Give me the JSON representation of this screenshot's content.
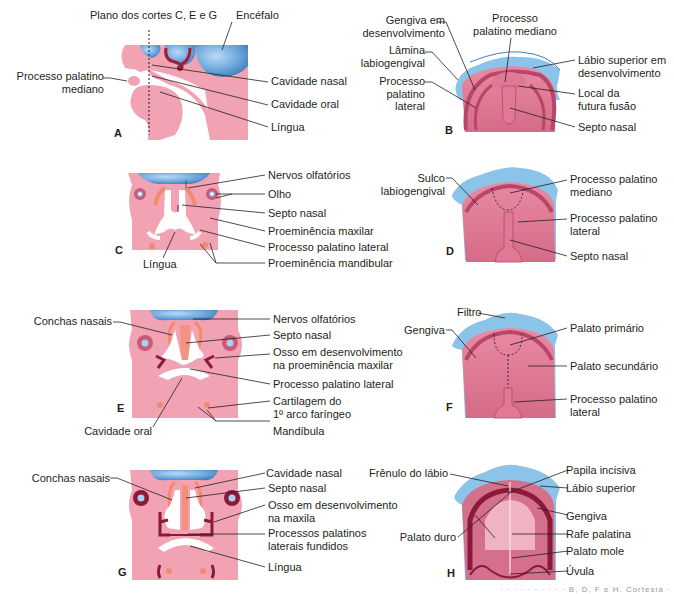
{
  "colors": {
    "tissue_pink": "#f2a3b3",
    "tissue_dark": "#c95a78",
    "tissue_mid": "#d9768f",
    "vessel_red": "#a01c3c",
    "brain_blue": "#6fa8dc",
    "lip_blue": "#8cc3e8",
    "cartilage_orange": "#f28b6b",
    "bone_maroon": "#8b1a3a",
    "text": "#231f20",
    "leader_line": "#231f20"
  },
  "panels": {
    "A": {
      "letter": "A",
      "labels": {
        "plane": "Plano dos cortes C, E e G",
        "brain": "Encéfalo",
        "median_palatine": [
          "Processo palatino",
          "mediano"
        ],
        "nasal_cavity": "Cavidade nasal",
        "oral_cavity": "Cavidade oral",
        "tongue": "Língua"
      }
    },
    "B": {
      "letter": "B",
      "labels": {
        "gum": [
          "Gengiva em",
          "desenvolvimento"
        ],
        "median_palatine": [
          "Processo",
          "palatino mediano"
        ],
        "labiogingival_lamina": [
          "Lâmina",
          "labiogengival"
        ],
        "upper_lip": [
          "Lábio superior em",
          "desenvolvimento"
        ],
        "lateral_palatine": [
          "Processo",
          "palatino",
          "lateral"
        ],
        "fusion_site": [
          "Local da",
          "futura fusão"
        ],
        "nasal_septum": "Septo nasal"
      }
    },
    "C": {
      "letter": "C",
      "labels": {
        "olfactory_nerves": "Nervos olfatórios",
        "eye": "Olho",
        "nasal_septum": "Septo nasal",
        "maxillary_prominence": "Proeminência maxilar",
        "lateral_palatine": "Processo palatino lateral",
        "tongue": "Língua",
        "mandibular_prominence": "Proeminência mandibular"
      }
    },
    "D": {
      "letter": "D",
      "labels": {
        "labiogingival_groove": [
          "Sulco",
          "labiogengival"
        ],
        "median_palatine": [
          "Processo palatino",
          "mediano"
        ],
        "lateral_palatine": [
          "Processo palatino",
          "lateral"
        ],
        "nasal_septum": "Septo nasal"
      }
    },
    "E": {
      "letter": "E",
      "labels": {
        "nasal_conchae": "Conchas nasais",
        "olfactory_nerves": "Nervos olfatórios",
        "nasal_septum": "Septo nasal",
        "developing_bone": [
          "Osso em desenvolvimento",
          "na proeminência maxilar"
        ],
        "lateral_palatine": "Processo palatino lateral",
        "cartilage": [
          "Cartilagem do",
          "1º arco faríngeo"
        ],
        "oral_cavity": "Cavidade oral",
        "mandible": "Mandíbula"
      }
    },
    "F": {
      "letter": "F",
      "labels": {
        "philtrum": "Filtro",
        "gum": "Gengiva",
        "primary_palate": "Palato primário",
        "secondary_palate": "Palato secundário",
        "lateral_palatine": [
          "Processo palatino",
          "lateral"
        ]
      }
    },
    "G": {
      "letter": "G",
      "labels": {
        "nasal_conchae": "Conchas nasais",
        "nasal_cavity": "Cavidade nasal",
        "nasal_septum": "Septo nasal",
        "developing_bone": [
          "Osso em desenvolvimento",
          "na maxila"
        ],
        "fused_processes": [
          "Processos palatinos",
          "laterais fundidos"
        ],
        "tongue": "Língua"
      }
    },
    "H": {
      "letter": "H",
      "labels": {
        "lip_frenulum": "Frênulo do lábio",
        "incisive_papilla": "Papila incisiva",
        "upper_lip": "Lábio superior",
        "gum": "Gengiva",
        "hard_palate": "Palato duro",
        "palatine_raphe": "Rafe palatina",
        "soft_palate": "Palato mole",
        "uvula": "Úvula"
      }
    }
  },
  "caption_faint": "· · · · · · · · · · B, D, F e H. Cortesia ·"
}
